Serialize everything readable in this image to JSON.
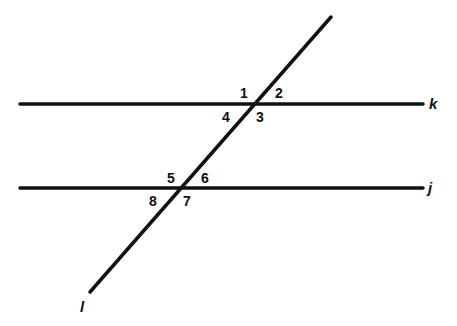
{
  "diagram": {
    "type": "parallel lines cut by a transversal",
    "line_color": "#111111",
    "lines": [
      {
        "name": "k",
        "label": "k",
        "x1": 20,
        "y1": 104,
        "x2": 423,
        "y2": 104
      },
      {
        "name": "j",
        "label": "j",
        "x1": 20,
        "y1": 188,
        "x2": 423,
        "y2": 188
      },
      {
        "name": "l",
        "label": "l",
        "x1": 331,
        "y1": 17,
        "x2": 90,
        "y2": 292
      }
    ],
    "angles": [
      "1",
      "2",
      "3",
      "4",
      "5",
      "6",
      "7",
      "8"
    ]
  }
}
